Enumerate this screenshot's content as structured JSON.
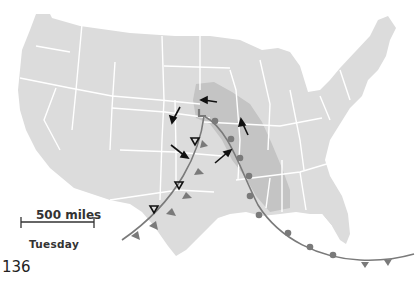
{
  "map": {
    "title": "",
    "region": "Contiguous United States",
    "land_color": "#dcdcdc",
    "storm_zone_color": "#c4c4c4",
    "state_border_color": "#ffffff",
    "front_color": "#7a7a7a",
    "arrow_color": "#111111",
    "low_pressure_symbol": "L",
    "symbols": [
      {
        "type": "low-pressure-center",
        "label": "L"
      },
      {
        "type": "cold-front"
      },
      {
        "type": "warm-front"
      },
      {
        "type": "wind-arrow",
        "count": 6
      },
      {
        "type": "thunderstorm-triangle",
        "count": 4
      }
    ]
  },
  "legend": {
    "scale_label": "500 miles",
    "day_label": "Tuesday"
  },
  "page": {
    "number": "136"
  }
}
